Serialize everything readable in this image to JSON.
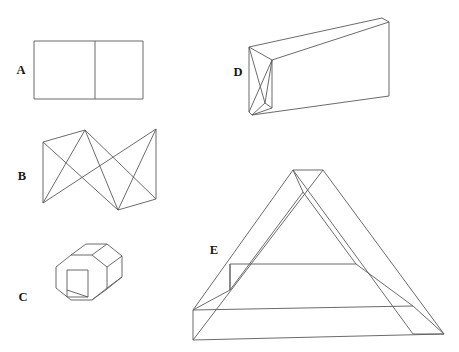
{
  "page": {
    "background_color": "#ffffff",
    "stroke_color": "#5a5a5a",
    "label_color": "#171717",
    "width": 459,
    "height": 352
  },
  "figures": [
    {
      "id": "A",
      "label": "A",
      "name": "divided-rectangle",
      "description": "Flat rectangle split by a single vertical line into two panels",
      "label_x": 21,
      "label_y": 71,
      "paths": [
        "M 34 41 L 143 41 L 143 99 L 34 99 Z",
        "M 95 41 L 95 99"
      ]
    },
    {
      "id": "B",
      "label": "B",
      "name": "bowtie-folded-surface",
      "description": "Bow-tie / hourglass folded surface seen in perspective with two vertical end edges",
      "label_x": 22,
      "label_y": 177,
      "paths": [
        "M 43 142 L 43 203",
        "M 156 129 L 156 199",
        "M 43 142 L 85 130 L 156 199 L 118 210 Z",
        "M 43 203 L 85 130",
        "M 43 142 L 118 210",
        "M 85 130 L 118 210",
        "M 43 203 L 156 129",
        "M 118 210 L 156 129"
      ]
    },
    {
      "id": "C",
      "label": "C",
      "name": "octagonal-prism-with-slot",
      "description": "Octagonal prism drawn in three-quarter view with a rectangular slot through the front face",
      "label_x": 23,
      "label_y": 298,
      "paths": [
        "M 57 266 L 72 255 L 93 255 L 108 266 L 108 287 L 93 298 L 72 298 L 57 287 Z",
        "M 72 255 L 87 246 L 108 246 L 123 257 L 123 278 L 108 289 L 93 298",
        "M 108 266 L 123 257",
        "M 108 287 L 123 278",
        "M 72 255 L 72 255",
        "M 67 270 L 88 270 L 88 297 L 67 297 Z",
        "M 67 290 L 88 297",
        "M 93 255 L 108 246",
        "M 57 266 L 72 255"
      ]
    },
    {
      "id": "D",
      "label": "D",
      "name": "folded-prism-wedge",
      "description": "Long wedge / folded prism with a crease running along its length and triangular creases at the near end",
      "label_x": 238,
      "label_y": 73,
      "paths": [
        "M 249 47 L 382 18 L 389 22 L 389 96 L 252 115 L 249 112 Z",
        "M 249 47 L 249 112",
        "M 382 18 L 389 22",
        "M 389 96 L 252 115",
        "M 249 47 L 272 60 L 389 22",
        "M 272 60 L 272 108",
        "M 249 112 L 272 60",
        "M 249 47 L 265 103",
        "M 265 103 L 272 60",
        "M 265 103 L 252 115",
        "M 265 103 L 272 108",
        "M 272 108 L 252 115"
      ]
    },
    {
      "id": "E",
      "label": "E",
      "name": "penrose-impossible-triangle",
      "description": "Penrose impossible triangle / tribar drawn as a three-bar closed loop",
      "label_x": 214,
      "label_y": 251,
      "paths": [
        "M 293 170 L 323 170 L 444 334 L 413 334 Z",
        "M 323 170 L 193 340 L 193 310 L 293 170",
        "M 193 340 L 444 334",
        "M 193 310 L 413 306",
        "M 230 290 L 303 192 L 356 264 L 230 264 Z",
        "M 230 264 L 230 290",
        "M 303 192 L 293 170",
        "M 356 264 L 413 306",
        "M 230 290 L 193 310",
        "M 323 170 L 303 192",
        "M 444 334 L 413 306",
        "M 193 340 L 193 310"
      ]
    }
  ]
}
